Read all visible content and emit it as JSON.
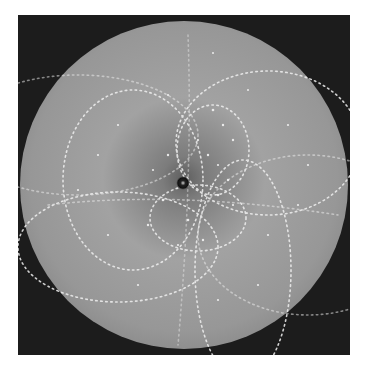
{
  "image": {
    "description": "Laue X-ray diffraction pattern on circular detector",
    "colors": {
      "background": "#ffffff",
      "frame": "#1c1c1c",
      "disk_center": "#6e6e6e",
      "disk_mid": "#9a9a9a",
      "disk_edge": "#8a8a8a",
      "spot": "#f2f2f2",
      "beam_stop": "#111111"
    },
    "detector": {
      "cx": 166,
      "cy": 170,
      "r": 164
    },
    "beam_stop": {
      "cx": 165,
      "cy": 168,
      "r": 6
    },
    "zone_arcs": [
      {
        "cx": 195,
        "cy": 135,
        "rx": 36,
        "ry": 45
      },
      {
        "cx": 180,
        "cy": 200,
        "rx": 50,
        "ry": 35
      },
      {
        "cx": 120,
        "cy": 160,
        "rx": 75,
        "ry": 90
      },
      {
        "cx": 220,
        "cy": 250,
        "rx": 50,
        "ry": 110
      },
      {
        "cx": 100,
        "cy": 230,
        "rx": 100,
        "ry": 55
      },
      {
        "cx": 250,
        "cy": 130,
        "rx": 90,
        "ry": 70
      }
    ]
  }
}
